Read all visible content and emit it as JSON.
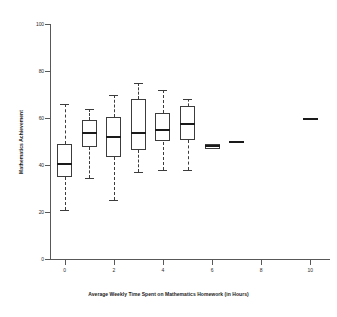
{
  "chart_data": {
    "type": "box",
    "title": "",
    "xlabel": "Average Weekly Time Spent on Mathematics Homework (in Hours)",
    "ylabel": "Mathematics Achievement",
    "xlim": [
      -0.6,
      10.8
    ],
    "ylim": [
      0,
      104
    ],
    "grid": false,
    "legend": null,
    "x_ticks": [
      0,
      2,
      4,
      6,
      8,
      10
    ],
    "x_tick_labels": [
      "0",
      "2",
      "4",
      "6",
      "8",
      "10"
    ],
    "y_ticks": [
      0,
      20,
      40,
      60,
      80,
      100
    ],
    "y_tick_labels": [
      "0",
      "20",
      "40",
      "60",
      "80",
      "100"
    ],
    "categories": [
      "0",
      "1",
      "2",
      "3",
      "4",
      "5",
      "6",
      "7",
      "10"
    ],
    "boxes": [
      {
        "x": 0,
        "whisker_low": 21.0,
        "q1": 35.0,
        "median": 40.5,
        "q3": 49.0,
        "whisker_high": 66.0,
        "has_box": true,
        "has_whiskers": true
      },
      {
        "x": 1,
        "whisker_low": 34.5,
        "q1": 47.5,
        "median": 53.5,
        "q3": 59.0,
        "whisker_high": 64.0,
        "has_box": true,
        "has_whiskers": true
      },
      {
        "x": 2,
        "whisker_low": 25.0,
        "q1": 43.5,
        "median": 52.0,
        "q3": 60.5,
        "whisker_high": 70.0,
        "has_box": true,
        "has_whiskers": true
      },
      {
        "x": 3,
        "whisker_low": 37.0,
        "q1": 46.5,
        "median": 53.5,
        "q3": 68.0,
        "whisker_high": 75.0,
        "has_box": true,
        "has_whiskers": true
      },
      {
        "x": 4,
        "whisker_low": 38.0,
        "q1": 50.0,
        "median": 55.0,
        "q3": 62.0,
        "whisker_high": 72.0,
        "has_box": true,
        "has_whiskers": true
      },
      {
        "x": 5,
        "whisker_low": 38.0,
        "q1": 50.5,
        "median": 57.5,
        "q3": 65.0,
        "whisker_high": 68.0,
        "has_box": true,
        "has_whiskers": true
      },
      {
        "x": 6,
        "whisker_low": 47.0,
        "q1": 47.0,
        "median": 48.0,
        "q3": 49.0,
        "whisker_high": 49.0,
        "has_box": true,
        "has_whiskers": false
      },
      {
        "x": 7,
        "whisker_low": 50.0,
        "q1": 50.0,
        "median": 50.0,
        "q3": 50.0,
        "whisker_high": 50.0,
        "has_box": false,
        "has_whiskers": false
      },
      {
        "x": 10,
        "whisker_low": 59.5,
        "q1": 59.5,
        "median": 59.5,
        "q3": 59.5,
        "whisker_high": 59.5,
        "has_box": false,
        "has_whiskers": false
      }
    ],
    "colors": {
      "box_stroke": "#3c3c3c",
      "median": "#1a1a1a",
      "whisker": "#3c3c3c",
      "axis": "#585858",
      "background": "#ffffff"
    }
  }
}
